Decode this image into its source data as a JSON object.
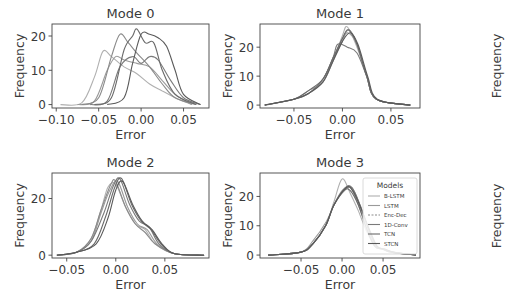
{
  "chart_data": [
    {
      "type": "line",
      "title": "Mode 0",
      "xlabel": "Error",
      "ylabel": "Frequency",
      "xticks": [
        "-0.10",
        "-0.05",
        "0.00",
        "0.05"
      ],
      "xtick_values": [
        -0.1,
        -0.05,
        0.0,
        0.05
      ],
      "yticks": [
        "0",
        "10",
        "20"
      ],
      "ytick_values": [
        0,
        10,
        20
      ],
      "xlim": [
        -0.105,
        0.08
      ],
      "ylim": [
        -1,
        23.5
      ],
      "series": [
        {
          "name": "B-LSTM",
          "x": [
            -0.095,
            -0.07,
            -0.055,
            -0.045,
            -0.035,
            -0.02,
            -0.005,
            0.01,
            0.025,
            0.04,
            0.06
          ],
          "values": [
            0,
            0.5,
            8,
            15.5,
            14,
            11,
            9,
            6,
            4,
            2,
            0
          ]
        },
        {
          "name": "LSTM",
          "x": [
            -0.075,
            -0.055,
            -0.04,
            -0.03,
            -0.02,
            -0.005,
            0.01,
            0.025,
            0.04,
            0.06
          ],
          "values": [
            0,
            1,
            10,
            14,
            13,
            12,
            11,
            7,
            3,
            0
          ]
        },
        {
          "name": "Enc-Dec",
          "x": [
            -0.07,
            -0.05,
            -0.035,
            -0.025,
            -0.015,
            -0.005,
            0.01,
            0.025,
            0.04,
            0.065
          ],
          "values": [
            0,
            2,
            14,
            20.5,
            18,
            15,
            11,
            6,
            2,
            0
          ]
        },
        {
          "name": "1D-Conv",
          "x": [
            -0.06,
            -0.04,
            -0.025,
            -0.01,
            0.0,
            0.01,
            0.02,
            0.035,
            0.05,
            0.07
          ],
          "values": [
            0,
            1,
            11,
            14,
            12,
            14,
            13,
            7,
            2,
            0
          ]
        },
        {
          "name": "TCN",
          "x": [
            -0.055,
            -0.035,
            -0.02,
            -0.01,
            -0.005,
            0.005,
            0.015,
            0.025,
            0.04,
            0.065
          ],
          "values": [
            0,
            2,
            16,
            20,
            22,
            18,
            18,
            10,
            3,
            0
          ]
        },
        {
          "name": "STCN",
          "x": [
            -0.04,
            -0.02,
            -0.01,
            0.0,
            0.01,
            0.02,
            0.03,
            0.04,
            0.05,
            0.07
          ],
          "values": [
            0,
            2,
            12,
            20.5,
            20.5,
            19.5,
            17,
            10,
            3,
            0
          ]
        }
      ]
    },
    {
      "type": "line",
      "title": "Mode 1",
      "xlabel": "Error",
      "ylabel": "Frequency",
      "xticks": [
        "-0.05",
        "0.00",
        "0.05"
      ],
      "xtick_values": [
        -0.05,
        0.0,
        0.05
      ],
      "yticks": [
        "0",
        "10",
        "20"
      ],
      "ytick_values": [
        0,
        10,
        20
      ],
      "xlim": [
        -0.085,
        0.08
      ],
      "ylim": [
        -1,
        28
      ],
      "series": [
        {
          "name": "B-LSTM",
          "x": [
            -0.08,
            -0.05,
            -0.035,
            -0.02,
            -0.01,
            0.0,
            0.005,
            0.015,
            0.025,
            0.035,
            0.07
          ],
          "values": [
            0,
            2,
            4,
            8,
            15,
            24,
            27,
            20,
            10,
            2,
            0
          ]
        },
        {
          "name": "LSTM",
          "x": [
            -0.08,
            -0.05,
            -0.035,
            -0.02,
            -0.01,
            0.0,
            0.005,
            0.015,
            0.025,
            0.035,
            0.07
          ],
          "values": [
            0,
            2,
            5,
            8,
            15,
            22,
            25,
            21,
            10,
            2,
            0
          ]
        },
        {
          "name": "Enc-Dec",
          "x": [
            -0.08,
            -0.05,
            -0.035,
            -0.02,
            -0.01,
            0.0,
            0.007,
            0.015,
            0.025,
            0.035,
            0.07
          ],
          "values": [
            0,
            2,
            4,
            9,
            16,
            23,
            26,
            21,
            10,
            2,
            0
          ]
        },
        {
          "name": "1D-Conv",
          "x": [
            -0.08,
            -0.05,
            -0.035,
            -0.02,
            -0.01,
            -0.005,
            0.005,
            0.015,
            0.025,
            0.035,
            0.07
          ],
          "values": [
            0,
            2,
            4,
            9,
            16,
            21,
            20,
            18,
            10,
            2,
            0
          ]
        },
        {
          "name": "TCN",
          "x": [
            -0.08,
            -0.05,
            -0.035,
            -0.02,
            -0.01,
            0.0,
            0.006,
            0.015,
            0.025,
            0.035,
            0.07
          ],
          "values": [
            0,
            2,
            5,
            9,
            16,
            23,
            26,
            21,
            10,
            2,
            0
          ]
        },
        {
          "name": "STCN",
          "x": [
            -0.08,
            -0.05,
            -0.035,
            -0.02,
            -0.01,
            0.0,
            0.008,
            0.016,
            0.026,
            0.036,
            0.07
          ],
          "values": [
            0,
            2,
            4,
            8,
            15,
            22,
            25,
            21,
            10,
            2,
            0
          ]
        }
      ]
    },
    {
      "type": "line",
      "title": "Mode 2",
      "xlabel": "Error",
      "ylabel": "Frequency",
      "xticks": [
        "-0.05",
        "0.00",
        "0.05"
      ],
      "xtick_values": [
        -0.05,
        0.0,
        0.05
      ],
      "yticks": [
        "0",
        "20"
      ],
      "ytick_values": [
        0,
        20
      ],
      "xlim": [
        -0.065,
        0.095
      ],
      "ylim": [
        -1,
        29
      ],
      "series": [
        {
          "name": "B-LSTM",
          "x": [
            -0.06,
            -0.04,
            -0.025,
            -0.015,
            -0.008,
            0.0,
            0.01,
            0.02,
            0.03,
            0.04,
            0.06,
            0.09
          ],
          "values": [
            0,
            1,
            6,
            16,
            24,
            25,
            17,
            11,
            9,
            4,
            0.5,
            0
          ]
        },
        {
          "name": "LSTM",
          "x": [
            -0.06,
            -0.04,
            -0.025,
            -0.015,
            -0.006,
            0.002,
            0.012,
            0.022,
            0.032,
            0.042,
            0.06,
            0.09
          ],
          "values": [
            0,
            1,
            5,
            15,
            23,
            26,
            17,
            11,
            9,
            4,
            0.5,
            0
          ]
        },
        {
          "name": "Enc-Dec",
          "x": [
            -0.06,
            -0.04,
            -0.025,
            -0.015,
            -0.005,
            0.0,
            0.01,
            0.02,
            0.03,
            0.04,
            0.06,
            0.09
          ],
          "values": [
            0,
            1,
            6,
            16,
            25,
            26,
            17,
            11,
            8,
            4,
            0.5,
            0
          ]
        },
        {
          "name": "1D-Conv",
          "x": [
            -0.06,
            -0.04,
            -0.025,
            -0.012,
            -0.003,
            0.004,
            0.014,
            0.024,
            0.034,
            0.044,
            0.06,
            0.09
          ],
          "values": [
            0,
            1,
            5,
            15,
            24,
            27,
            18,
            12,
            10,
            4,
            0.5,
            0
          ]
        },
        {
          "name": "TCN",
          "x": [
            -0.06,
            -0.04,
            -0.022,
            -0.01,
            -0.001,
            0.006,
            0.016,
            0.026,
            0.036,
            0.046,
            0.06,
            0.09
          ],
          "values": [
            0,
            1,
            4,
            14,
            24,
            27,
            18,
            12,
            9,
            4,
            0.5,
            0
          ]
        },
        {
          "name": "STCN",
          "x": [
            -0.06,
            -0.04,
            -0.02,
            -0.008,
            0.0,
            0.007,
            0.017,
            0.027,
            0.037,
            0.047,
            0.06,
            0.09
          ],
          "values": [
            0,
            1,
            4,
            13,
            23,
            26,
            18,
            12,
            9,
            4,
            0.5,
            0
          ]
        }
      ]
    },
    {
      "type": "line",
      "title": "Mode 3",
      "xlabel": "Error",
      "ylabel": "Frequency",
      "xticks": [
        "-0.05",
        "0.00",
        "0.05"
      ],
      "xtick_values": [
        -0.05,
        0.0,
        0.05
      ],
      "yticks": [
        "0",
        "10",
        "20"
      ],
      "ytick_values": [
        0,
        10,
        20
      ],
      "xlim": [
        -0.1,
        0.095
      ],
      "ylim": [
        -1,
        28
      ],
      "series": [
        {
          "name": "B-LSTM",
          "x": [
            -0.09,
            -0.05,
            -0.035,
            -0.02,
            -0.01,
            0.0,
            0.01,
            0.02,
            0.03,
            0.04,
            0.05,
            0.06,
            0.09
          ],
          "values": [
            0,
            1,
            4,
            10,
            18,
            26,
            21,
            15,
            8,
            3,
            2,
            1,
            0
          ]
        },
        {
          "name": "LSTM",
          "x": [
            -0.09,
            -0.05,
            -0.035,
            -0.02,
            -0.01,
            0.0,
            0.01,
            0.02,
            0.03,
            0.04,
            0.05,
            0.06,
            0.09
          ],
          "values": [
            0,
            1,
            5,
            11,
            17,
            22,
            23,
            17,
            9,
            3,
            2,
            1,
            0
          ]
        },
        {
          "name": "Enc-Dec",
          "x": [
            -0.09,
            -0.05,
            -0.035,
            -0.02,
            -0.01,
            0.003,
            0.012,
            0.022,
            0.032,
            0.042,
            0.052,
            0.062,
            0.09
          ],
          "values": [
            0,
            1,
            4,
            10,
            17,
            22,
            23,
            17,
            9,
            3,
            2,
            1,
            0
          ]
        },
        {
          "name": "1D-Conv",
          "x": [
            -0.09,
            -0.05,
            -0.035,
            -0.02,
            -0.01,
            0.004,
            0.012,
            0.022,
            0.032,
            0.042,
            0.052,
            0.062,
            0.09
          ],
          "values": [
            0,
            1,
            4,
            10,
            17,
            23,
            23,
            17,
            9,
            3,
            2,
            1,
            0
          ]
        },
        {
          "name": "TCN",
          "x": [
            -0.09,
            -0.05,
            -0.035,
            -0.02,
            -0.01,
            0.002,
            0.01,
            0.02,
            0.03,
            0.04,
            0.05,
            0.06,
            0.09
          ],
          "values": [
            0,
            1,
            4,
            10,
            17,
            22,
            22,
            17,
            9,
            3,
            2,
            1,
            0
          ]
        },
        {
          "name": "STCN",
          "x": [
            -0.09,
            -0.05,
            -0.035,
            -0.02,
            -0.01,
            0.005,
            0.013,
            0.023,
            0.033,
            0.043,
            0.053,
            0.063,
            0.09
          ],
          "values": [
            0,
            1,
            4,
            10,
            17,
            23,
            22,
            16,
            9,
            3,
            2,
            1,
            0
          ]
        }
      ],
      "legend": {
        "title": "Models",
        "position": "upper right",
        "entries": [
          "B-LSTM",
          "LSTM",
          "Enc-Dec",
          "1D-Conv",
          "TCN",
          "STCN"
        ]
      }
    }
  ],
  "layout": {
    "right_edge_labels": [
      "Frequency",
      "Frequency"
    ],
    "series_colors": [
      "#b0b0b0",
      "#9a9a9a",
      "#8a8a8a",
      "#7a7a7a",
      "#6a6a6a",
      "#5a5a5a"
    ],
    "axis_color": "#444444",
    "text_color": "#3a3a3a"
  }
}
